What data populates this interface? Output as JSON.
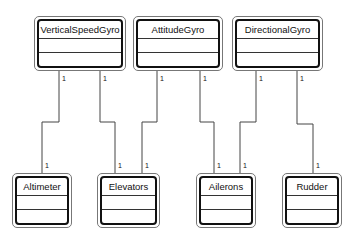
{
  "diagram": {
    "type": "UML class diagram",
    "classes": [
      {
        "id": "vsg",
        "name": "VerticalSpeedGyro"
      },
      {
        "id": "ag",
        "name": "AttitudeGyro"
      },
      {
        "id": "dg",
        "name": "DirectionalGyro"
      },
      {
        "id": "alt",
        "name": "Altimeter"
      },
      {
        "id": "elv",
        "name": "Elevators"
      },
      {
        "id": "ail",
        "name": "Ailerons"
      },
      {
        "id": "rud",
        "name": "Rudder"
      }
    ],
    "associations": [
      {
        "from": "vsg",
        "to": "alt",
        "from_mult": "1",
        "to_mult": "1"
      },
      {
        "from": "vsg",
        "to": "elv",
        "from_mult": "1",
        "to_mult": "1"
      },
      {
        "from": "ag",
        "to": "elv",
        "from_mult": "1",
        "to_mult": "1"
      },
      {
        "from": "ag",
        "to": "ail",
        "from_mult": "1",
        "to_mult": "1"
      },
      {
        "from": "dg",
        "to": "ail",
        "from_mult": "1",
        "to_mult": "1"
      },
      {
        "from": "dg",
        "to": "rud",
        "from_mult": "1",
        "to_mult": "1"
      }
    ]
  }
}
